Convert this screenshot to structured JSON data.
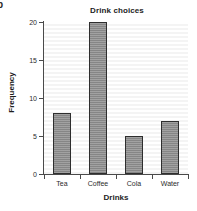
{
  "figure": {
    "caption_mark": "b",
    "background_color": "#ffffff"
  },
  "chart_data": {
    "type": "bar",
    "title": "Drink choices",
    "xlabel": "Drinks",
    "ylabel": "Frequency",
    "categories": [
      "Tea",
      "Coffee",
      "Cola",
      "Water"
    ],
    "values": [
      8,
      20,
      5,
      7
    ],
    "ylim": [
      0,
      20
    ],
    "yticks": [
      0,
      5,
      10,
      15,
      20
    ],
    "ytick_labels": [
      "0",
      "5",
      "10",
      "15",
      "20"
    ],
    "grid": true,
    "legend": null,
    "bar_color": "#8d8d8d",
    "bar_edge_color": "#2e2e2e",
    "axis_color": "#4a4a4a",
    "text_color": "#1d1d1d"
  }
}
